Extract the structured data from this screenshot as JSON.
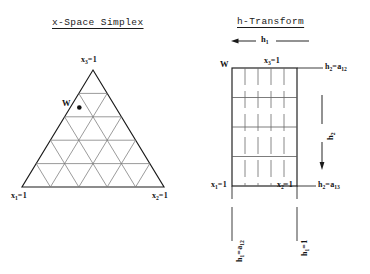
{
  "figure": {
    "width": 370,
    "height": 274,
    "background": "#ffffff",
    "ink": "#1a1a1a",
    "grid_color": "#7a7a7a"
  },
  "left_panel": {
    "title": "x-Space Simplex",
    "vertex_top": {
      "var": "x",
      "sub": "3",
      "eq": "=",
      "value": "1"
    },
    "vertex_left": {
      "var": "x",
      "sub": "1",
      "eq": "=",
      "value": "1"
    },
    "vertex_right": {
      "var": "x",
      "sub": "2",
      "eq": "=",
      "value": "1"
    },
    "point_label": "W"
  },
  "right_panel": {
    "title": "h-Transform",
    "axis_h1": {
      "var": "h",
      "sub": "1"
    },
    "axis_h2": {
      "var": "h",
      "sub": "2"
    },
    "corner_label": "W",
    "top_right_inner": {
      "var": "x",
      "sub": "3",
      "eq": "=",
      "value": "1"
    },
    "top_right_outer": {
      "var": "h",
      "sub": "2",
      "eq": "=",
      "value": "a",
      "value_sub": "12"
    },
    "bottom_left_inner": {
      "var": "x",
      "sub": "1",
      "eq": "=",
      "value": "1"
    },
    "bottom_right_inner": {
      "var": "x",
      "sub": "2",
      "eq": "=",
      "value": "1"
    },
    "bottom_right_outer": {
      "var": "h",
      "sub": "2",
      "eq": "=",
      "value": "a",
      "value_sub": "13"
    },
    "bottom_left_vertical": {
      "var": "h",
      "sub": "1",
      "eq": "=",
      "value": "a",
      "value_sub": "12"
    },
    "bottom_right_vertical": {
      "var": "h",
      "sub": "1",
      "eq": "=",
      "value": "1"
    }
  }
}
